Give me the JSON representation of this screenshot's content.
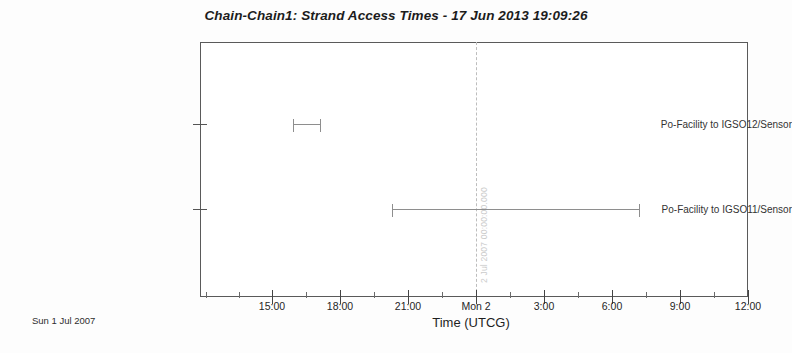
{
  "chart_data": {
    "type": "bar",
    "title": "Chain-Chain1:  Strand Access Times - 17 Jun 2013 19:09:26",
    "xlabel": "Time (UTCG)",
    "ylabel": "",
    "grid": false,
    "legend": "none",
    "orientation": "horizontal",
    "xlim": [
      "2007-07-01 13:30:00",
      "2007-07-02 12:00:00"
    ],
    "x_tick_labels": [
      "15:00",
      "18:00",
      "21:00",
      "Mon 2",
      "3:00",
      "6:00",
      "9:00",
      "12:00"
    ],
    "x_tick_positions": [
      272,
      340,
      408,
      476,
      544,
      612,
      680,
      748
    ],
    "x_minor_tick_positions": [
      206,
      239,
      306,
      374,
      442,
      510,
      578,
      646,
      714
    ],
    "categories": [
      "Po-Facility to IGSO12/Sensor",
      "Po-Facility to IGSO11/Sensor"
    ],
    "series": [
      {
        "name": "Strand Access Interval",
        "values": [
          {
            "category": "Po-Facility to IGSO12/Sensor",
            "start_label": "15:42",
            "stop_label": "16:55",
            "row_y": 124,
            "x_start": 293,
            "x_stop": 321
          },
          {
            "category": "Po-Facility to IGSO11/Sensor",
            "start_label": "20:20",
            "stop_label": "10:15",
            "row_y": 209,
            "x_start": 392,
            "x_stop": 640
          }
        ]
      }
    ],
    "annotations": [
      {
        "name": "epoch-marker",
        "text": "2 Jul 2007 00:00:00.000",
        "x": 476,
        "style": "dashed-vertical-line"
      }
    ],
    "footer": "Sun 1  Jul 2007"
  },
  "chart": {
    "title": "Chain-Chain1:  Strand Access Times - 17 Jun 2013 19:09:26",
    "x_axis_title": "Time (UTCG)",
    "footer_date": "Sun 1  Jul 2007",
    "epoch_label": "2 Jul 2007 00:00:00.000",
    "y_labels": [
      "Po-Facility to IGSO12/Sensor",
      "Po-Facility to IGSO11/Sensor"
    ],
    "x_ticks": [
      "15:00",
      "18:00",
      "21:00",
      "Mon 2",
      "3:00",
      "6:00",
      "9:00",
      "12:00"
    ]
  },
  "colors": {
    "frame": "#5a5a5a",
    "bar": "#8e8e8e",
    "epoch_line": "#bdbdbd",
    "epoch_text": "#cbcbcb",
    "text": "#262626",
    "background": "#fdfdfd"
  }
}
